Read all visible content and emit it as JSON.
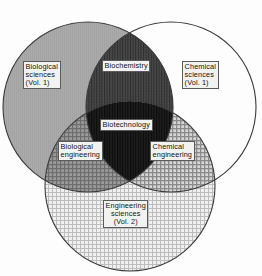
{
  "figure": {
    "kind": "venn-diagram",
    "set_count": 3,
    "background_color": "#fdfdfd",
    "outline_color": "#3a3a3a"
  },
  "sets": [
    {
      "id": "biological-sciences",
      "label": "Biological\nsciences\n(Vol. 1)",
      "label_lines": [
        "Biological",
        "sciences",
        "(Vol. 1)"
      ],
      "fill_color": "#a8a8a8",
      "fill_style": "solid-gray",
      "center": {
        "x": 88,
        "y": 107
      },
      "radius": 85
    },
    {
      "id": "chemical-sciences",
      "label": "Chemical\nsciences\n(Vol. 1)",
      "label_lines": [
        "Chemical",
        "sciences",
        "(Vol. 1)"
      ],
      "fill_color": "#ffffff",
      "fill_style": "blank",
      "center": {
        "x": 171,
        "y": 107
      },
      "radius": 85
    },
    {
      "id": "engineering-sciences",
      "label": "Engineering\nsciences\n(Vol. 2)",
      "label_lines": [
        "Engineering",
        "sciences",
        "(Vol. 2)"
      ],
      "fill_color": "#dcdcdc",
      "fill_style": "fine-crosshatch",
      "center": {
        "x": 130,
        "y": 186
      },
      "radius": 85
    }
  ],
  "intersections": [
    {
      "id": "biochemistry",
      "label": "Biochemistry",
      "members": [
        "biological-sciences",
        "chemical-sciences"
      ],
      "fill_color": "#474747",
      "fill_style": "dark-vertical-hatch"
    },
    {
      "id": "biological-engineering",
      "label": "Biological\nengineering",
      "label_lines": [
        "Biological",
        "engineering"
      ],
      "members": [
        "biological-sciences",
        "engineering-sciences"
      ],
      "fill_color": "#8c8c8c",
      "fill_style": "mid-crosshatch"
    },
    {
      "id": "chemical-engineering",
      "label": "Chemical\nengineering",
      "label_lines": [
        "Chemical",
        "engineering"
      ],
      "members": [
        "chemical-sciences",
        "engineering-sciences"
      ],
      "fill_color": "#a0a0a0",
      "fill_style": "mid-crosshatch"
    },
    {
      "id": "biotechnology",
      "label": "Biotechnology",
      "members": [
        "biological-sciences",
        "chemical-sciences",
        "engineering-sciences"
      ],
      "fill_color": "#1a1a1a",
      "fill_style": "very-dark"
    }
  ]
}
